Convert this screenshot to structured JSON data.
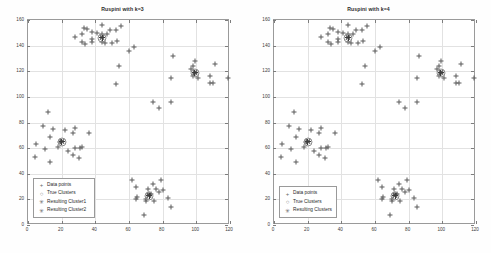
{
  "figures": [
    {
      "title": "Ruspini with k=3",
      "legend": {
        "items": [
          {
            "label": "Data points",
            "marker": "plus"
          },
          {
            "label": "True Clusters",
            "marker": "circle"
          },
          {
            "label": "Resulting Cluster1",
            "marker": "star"
          },
          {
            "label": "Resulting Cluster2",
            "marker": "star"
          }
        ]
      }
    },
    {
      "title": "Ruspini with k=4",
      "legend": {
        "items": [
          {
            "label": "Data points",
            "marker": "plus"
          },
          {
            "label": "True Clusters",
            "marker": "circle"
          },
          {
            "label": "Resulting Clusters",
            "marker": "star"
          }
        ]
      }
    }
  ],
  "axis": {
    "xticks": [
      0,
      20,
      40,
      60,
      80,
      100,
      120
    ],
    "yticks": [
      0,
      20,
      40,
      60,
      80,
      100,
      120,
      140,
      160
    ],
    "xlim": [
      0,
      120
    ],
    "ylim": [
      0,
      160
    ],
    "xlabel": "",
    "ylabel": "",
    "grid": true
  },
  "colors": {
    "marker": "#5b5b5b",
    "centroid": "#8d8d8d",
    "axis": "#9a9a9a",
    "grid": "#e2e2e2",
    "background": "#ffffff",
    "text": "#2a2a2a"
  },
  "chart_data": {
    "type": "scatter",
    "xlabel": "",
    "ylabel": "",
    "xlim": [
      0,
      120
    ],
    "ylim": [
      0,
      160
    ],
    "grid": true,
    "legend_position": "lower-left",
    "panels": [
      {
        "title": "Ruspini with k=3",
        "series": [
          {
            "name": "Data points",
            "marker": "plus",
            "points": [
              [
                4,
                53
              ],
              [
                5,
                63
              ],
              [
                10,
                59
              ],
              [
                9,
                77
              ],
              [
                13,
                49
              ],
              [
                13,
                69
              ],
              [
                12,
                88
              ],
              [
                15,
                75
              ],
              [
                18,
                61
              ],
              [
                19,
                65
              ],
              [
                22,
                74
              ],
              [
                27,
                72
              ],
              [
                28,
                76
              ],
              [
                24,
                58
              ],
              [
                27,
                55
              ],
              [
                28,
                60
              ],
              [
                30,
                52
              ],
              [
                31,
                60
              ],
              [
                32,
                61
              ],
              [
                36,
                72
              ],
              [
                28,
                147
              ],
              [
                32,
                149
              ],
              [
                35,
                153
              ],
              [
                33,
                154
              ],
              [
                38,
                151
              ],
              [
                41,
                150
              ],
              [
                38,
                145
              ],
              [
                38,
                143
              ],
              [
                32,
                143
              ],
              [
                34,
                141
              ],
              [
                44,
                156
              ],
              [
                44,
                149
              ],
              [
                44,
                143
              ],
              [
                46,
                142
              ],
              [
                47,
                149
              ],
              [
                49,
                152
              ],
              [
                50,
                142
              ],
              [
                53,
                144
              ],
              [
                52,
                152
              ],
              [
                55,
                155
              ],
              [
                54,
                124
              ],
              [
                60,
                136
              ],
              [
                63,
                139
              ],
              [
                86,
                132
              ],
              [
                85,
                115
              ],
              [
                85,
                96
              ],
              [
                78,
                91
              ],
              [
                74,
                96
              ],
              [
                97,
                122
              ],
              [
                98,
                116
              ],
              [
                98,
                124
              ],
              [
                99,
                119
              ],
              [
                99,
                128
              ],
              [
                101,
                115
              ],
              [
                108,
                111
              ],
              [
                110,
                111
              ],
              [
                108,
                116
              ],
              [
                111,
                126
              ],
              [
                119,
                115
              ],
              [
                52,
                110
              ],
              [
                64,
                30
              ],
              [
                62,
                35
              ],
              [
                64,
                20
              ],
              [
                65,
                22
              ],
              [
                70,
                20
              ],
              [
                70,
                19
              ],
              [
                71,
                28
              ],
              [
                72,
                24
              ],
              [
                73,
                24
              ],
              [
                74,
                32
              ],
              [
                75,
                19
              ],
              [
                76,
                28
              ],
              [
                78,
                26
              ],
              [
                79,
                35
              ],
              [
                80,
                27
              ],
              [
                83,
                21
              ],
              [
                85,
                14
              ],
              [
                69,
                8
              ],
              [
                12,
                8
              ]
            ]
          },
          {
            "name": "True Clusters",
            "marker": "circle",
            "points": [
              [
                20,
                65
              ],
              [
                44,
                146
              ],
              [
                99,
                119
              ],
              [
                72,
                23
              ]
            ]
          },
          {
            "name": "Resulting Cluster1",
            "marker": "star",
            "points": [
              [
                44,
                146
              ],
              [
                99,
                119
              ]
            ]
          },
          {
            "name": "Resulting Cluster2",
            "marker": "star",
            "points": [
              [
                20,
                65
              ],
              [
                72,
                23
              ]
            ]
          }
        ]
      },
      {
        "title": "Ruspini with k=4",
        "series": [
          {
            "name": "Data points",
            "marker": "plus",
            "points": [
              [
                4,
                53
              ],
              [
                5,
                63
              ],
              [
                10,
                59
              ],
              [
                9,
                77
              ],
              [
                13,
                49
              ],
              [
                13,
                69
              ],
              [
                12,
                88
              ],
              [
                15,
                75
              ],
              [
                18,
                61
              ],
              [
                19,
                65
              ],
              [
                22,
                74
              ],
              [
                27,
                72
              ],
              [
                28,
                76
              ],
              [
                24,
                58
              ],
              [
                27,
                55
              ],
              [
                28,
                60
              ],
              [
                30,
                52
              ],
              [
                31,
                60
              ],
              [
                32,
                61
              ],
              [
                36,
                72
              ],
              [
                28,
                147
              ],
              [
                32,
                149
              ],
              [
                35,
                153
              ],
              [
                33,
                154
              ],
              [
                38,
                151
              ],
              [
                41,
                150
              ],
              [
                38,
                145
              ],
              [
                38,
                143
              ],
              [
                32,
                143
              ],
              [
                34,
                141
              ],
              [
                44,
                156
              ],
              [
                44,
                149
              ],
              [
                44,
                143
              ],
              [
                46,
                142
              ],
              [
                47,
                149
              ],
              [
                49,
                152
              ],
              [
                50,
                142
              ],
              [
                53,
                144
              ],
              [
                52,
                152
              ],
              [
                55,
                155
              ],
              [
                54,
                124
              ],
              [
                60,
                136
              ],
              [
                63,
                139
              ],
              [
                86,
                132
              ],
              [
                85,
                115
              ],
              [
                85,
                96
              ],
              [
                78,
                91
              ],
              [
                74,
                96
              ],
              [
                97,
                122
              ],
              [
                98,
                116
              ],
              [
                98,
                124
              ],
              [
                99,
                119
              ],
              [
                99,
                128
              ],
              [
                101,
                115
              ],
              [
                108,
                111
              ],
              [
                110,
                111
              ],
              [
                108,
                116
              ],
              [
                111,
                126
              ],
              [
                119,
                115
              ],
              [
                52,
                110
              ],
              [
                64,
                30
              ],
              [
                62,
                35
              ],
              [
                64,
                20
              ],
              [
                65,
                22
              ],
              [
                70,
                20
              ],
              [
                70,
                19
              ],
              [
                71,
                28
              ],
              [
                72,
                24
              ],
              [
                73,
                24
              ],
              [
                74,
                32
              ],
              [
                75,
                19
              ],
              [
                76,
                28
              ],
              [
                78,
                26
              ],
              [
                79,
                35
              ],
              [
                80,
                27
              ],
              [
                83,
                21
              ],
              [
                85,
                14
              ],
              [
                69,
                8
              ],
              [
                12,
                8
              ]
            ]
          },
          {
            "name": "True Clusters",
            "marker": "circle",
            "points": [
              [
                20,
                65
              ],
              [
                44,
                146
              ],
              [
                99,
                119
              ],
              [
                72,
                23
              ]
            ]
          },
          {
            "name": "Resulting Clusters",
            "marker": "star",
            "points": [
              [
                20,
                65
              ],
              [
                44,
                146
              ],
              [
                99,
                119
              ],
              [
                72,
                23
              ]
            ]
          }
        ]
      }
    ]
  }
}
